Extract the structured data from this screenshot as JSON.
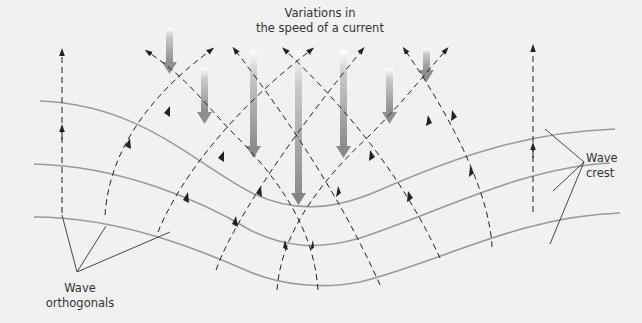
{
  "diagram": {
    "title_line1": "Variations in",
    "title_line2": "the speed of a current",
    "orthogonals_label_line1": "Wave",
    "orthogonals_label_line2": "orthogonals",
    "crest_label_line1": "Wave",
    "crest_label_line2": "crest",
    "colors": {
      "background": "#f1f1f1",
      "crest_line": "#9a9a9a",
      "orthogonal": "#222222",
      "current_arrow": "#8a8a8a",
      "text": "#333333"
    },
    "current_arrows": [
      {
        "x": 198,
        "y_start": 30,
        "y_end": 76
      },
      {
        "x": 205,
        "y_start": 68,
        "y_end": 126
      },
      {
        "x": 253,
        "y_start": 50,
        "y_end": 160
      },
      {
        "x": 298,
        "y_start": 50,
        "y_end": 206
      },
      {
        "x": 343,
        "y_start": 50,
        "y_end": 160
      },
      {
        "x": 392,
        "y_start": 68,
        "y_end": 126
      },
      {
        "x": 425,
        "y_start": 46,
        "y_end": 84
      }
    ]
  }
}
